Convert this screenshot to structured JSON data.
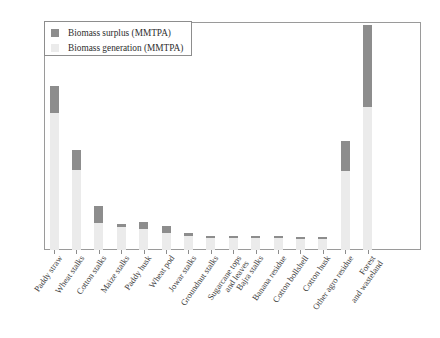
{
  "chart_data": {
    "type": "bar",
    "title": "",
    "subtitle": "",
    "xlabel": "",
    "ylabel": "",
    "ylim": [
      0,
      250
    ],
    "yticks": [
      0,
      50,
      100,
      150,
      200,
      250
    ],
    "grid": false,
    "stacked": true,
    "legend_position": "upper-left",
    "units": "MMTPA",
    "categories": [
      "Paddy straw",
      "Wheat stalks",
      "Cotton stalks",
      "Maize stalks",
      "Paddy husk",
      "Wheat pod",
      "Jowar stalks",
      "Groundnut stalks",
      "Sugarcane tops and leaves",
      "Bajra stalks",
      "Banana residue",
      "Cotton bollshell",
      "Cotton husk",
      "Other agro residue",
      "Forest and wasteland"
    ],
    "series": [
      {
        "name": "Biomass generation (MMTPA)",
        "color": "#ebebeb",
        "values": [
          150,
          88,
          30,
          25,
          23,
          19,
          15,
          13,
          13,
          13,
          13,
          12,
          12,
          87,
          157
        ]
      },
      {
        "name": "Biomass surplus (MMTPA)",
        "color": "#8d8d8d",
        "values": [
          30,
          22,
          18,
          3,
          8,
          7,
          4,
          2,
          2,
          2,
          2,
          2,
          2,
          32,
          90
        ]
      }
    ],
    "totals": [
      180,
      110,
      48,
      28,
      31,
      26,
      19,
      15,
      15,
      15,
      15,
      14,
      14,
      119,
      247
    ]
  },
  "legend": {
    "entries": [
      {
        "label": "Biomass surplus (MMTPA)",
        "swatch": "legend-swatch-surplus"
      },
      {
        "label": "Biomass generation (MMTPA)",
        "swatch": "legend-swatch-generation"
      }
    ]
  },
  "colors": {
    "surplus": "#8d8d8d",
    "generation": "#ebebeb",
    "axis": "#8d8d8d",
    "tick_text": "#5b5b5b",
    "label_text": "#3e3e3e",
    "background": "#ffffff"
  }
}
